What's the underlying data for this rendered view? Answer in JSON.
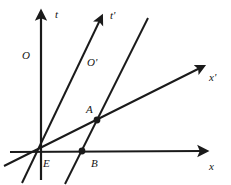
{
  "figure": {
    "type": "minkowski-spacetime-diagram",
    "background_color": "#ffffff",
    "stroke_color": "#1a1a1a",
    "label_color": "#141414",
    "width": 231,
    "height": 185
  },
  "axes": [
    {
      "id": "t",
      "label": "t",
      "label_x": 55,
      "label_y": 9,
      "x1": 41,
      "y1": 180,
      "x2": 41,
      "y2": 14,
      "arrow": true,
      "stroke_width": 2.2
    },
    {
      "id": "x",
      "label": "x",
      "label_x": 209,
      "label_y": 161,
      "x1": 10,
      "y1": 152,
      "x2": 204,
      "y2": 151,
      "arrow": true,
      "stroke_width": 2.2
    },
    {
      "id": "t-prime",
      "label": "t'",
      "label_x": 110,
      "label_y": 10,
      "x1": 22,
      "y1": 183,
      "x2": 101,
      "y2": 17,
      "arrow": true,
      "stroke_width": 2.0
    },
    {
      "id": "x-prime",
      "label": "x'",
      "label_x": 209,
      "label_y": 72,
      "x1": 4,
      "y1": 166,
      "x2": 202,
      "y2": 67,
      "arrow": true,
      "stroke_width": 2.0
    },
    {
      "id": "worldline-through-b",
      "label": "",
      "x1": 65,
      "y1": 184,
      "x2": 148,
      "y2": 18,
      "arrow": false,
      "stroke_width": 2.0
    }
  ],
  "points": [
    {
      "id": "E",
      "label": "E",
      "x": 40,
      "y": 152,
      "label_x": 43,
      "label_y": 158,
      "marker": false
    },
    {
      "id": "A",
      "label": "A",
      "x": 97,
      "y": 120,
      "label_x": 86,
      "label_y": 104,
      "marker": true
    },
    {
      "id": "B",
      "label": "B",
      "x": 82,
      "y": 151,
      "label_x": 91,
      "label_y": 158,
      "marker": true
    }
  ],
  "origin_labels": [
    {
      "id": "O",
      "label": "O",
      "x": 22,
      "y": 50
    },
    {
      "id": "O-prime",
      "label": "O'",
      "x": 87,
      "y": 57
    }
  ]
}
